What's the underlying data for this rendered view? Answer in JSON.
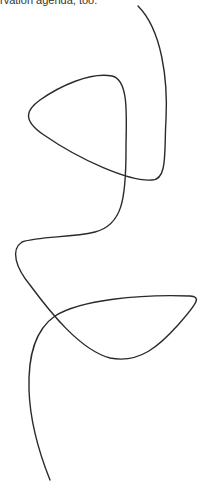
{
  "caption": {
    "text": "rvation agenda, too."
  },
  "drawing": {
    "stroke": "#2a2a2a",
    "stroke_width": 1.4
  }
}
